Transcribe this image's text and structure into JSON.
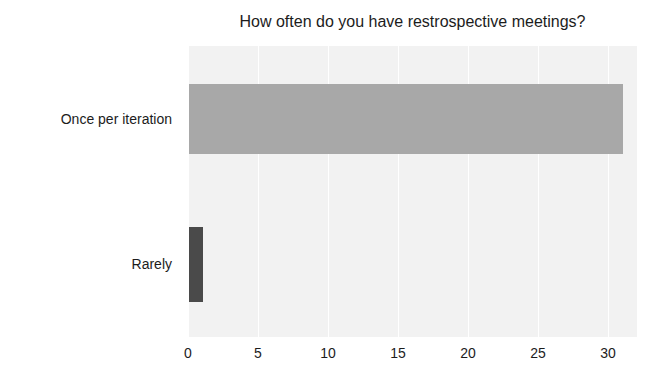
{
  "chart_data": {
    "type": "bar",
    "orientation": "horizontal",
    "title": "How often do you have restrospective meetings?",
    "xlabel": "",
    "ylabel": "",
    "categories": [
      "Once per iteration",
      "Rarely"
    ],
    "values": [
      31,
      1
    ],
    "series": [
      {
        "name": "Responses",
        "values": [
          31,
          1
        ]
      }
    ],
    "xticks": [
      0,
      5,
      10,
      15,
      20,
      25,
      30
    ],
    "xtick_labels": [
      "0",
      "5",
      "10",
      "15",
      "20",
      "25",
      "30"
    ],
    "xlim": [
      0,
      32.07
    ],
    "grid": "vertical",
    "legend": "none",
    "bar_colors": [
      "#a8a8a8",
      "#4a4a4a"
    ],
    "plot_background": "#f2f2f2",
    "gridline_color": "#ffffff",
    "text_color": "#1c1c1c"
  }
}
